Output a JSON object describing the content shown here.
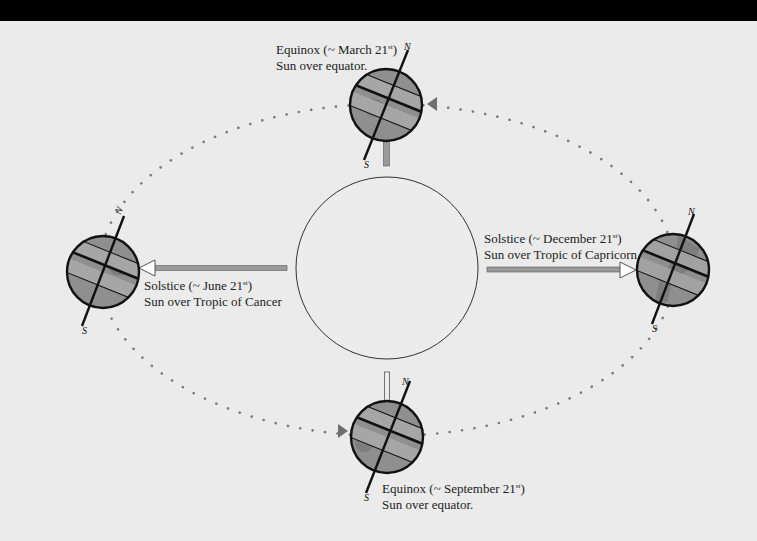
{
  "colors": {
    "background": "#ebebeb",
    "top_bar": "#000000",
    "globe_fill": "#8f8f8f",
    "globe_band": "#a6a6a6",
    "globe_land": "#7d7d7d",
    "orbit_dots": "#7a7a7a",
    "arrow_shaft": "#9a9a9a",
    "outline": "#111111"
  },
  "sun": {
    "label": ""
  },
  "positions": [
    {
      "id": "march",
      "title_prefix": "Equinox (~ March 21",
      "title_sup": "st",
      "title_suffix": ")",
      "subtitle": "Sun over equator.",
      "axis_north": "N",
      "axis_south": "S"
    },
    {
      "id": "june",
      "title_prefix": "Solstice (~ June 21",
      "title_sup": "st",
      "title_suffix": ")",
      "subtitle": "Sun over Tropic of Cancer",
      "axis_north": "N",
      "axis_south": "S"
    },
    {
      "id": "september",
      "title_prefix": "Equinox (~ September 21",
      "title_sup": "st",
      "title_suffix": ")",
      "subtitle": "Sun over equator.",
      "axis_north": "N",
      "axis_south": "S"
    },
    {
      "id": "december",
      "title_prefix": "Solstice (~ December 21",
      "title_sup": "st",
      "title_suffix": ")",
      "subtitle": "Sun over Tropic of Capricorn",
      "axis_north": "N",
      "axis_south": "S"
    }
  ]
}
